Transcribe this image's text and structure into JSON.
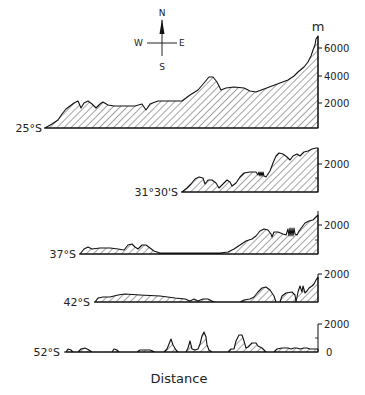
{
  "compass": {
    "north": "N",
    "south": "S",
    "east": "E",
    "west": "W"
  },
  "unit_label": "m",
  "x_axis_label": "Distance",
  "profiles": [
    {
      "latitude": "25°S",
      "scale_labels": [
        "6000",
        "4000",
        "2000"
      ]
    },
    {
      "latitude": "31°30'S",
      "scale_labels": [
        "2000"
      ]
    },
    {
      "latitude": "37°S",
      "scale_labels": [
        "2000"
      ]
    },
    {
      "latitude": "42°S",
      "scale_labels": [
        "2000"
      ]
    },
    {
      "latitude": "52°S",
      "scale_labels": [
        "2000",
        "0"
      ]
    }
  ],
  "colors": {
    "ink": "#1a1a1a",
    "background": "#ffffff"
  }
}
